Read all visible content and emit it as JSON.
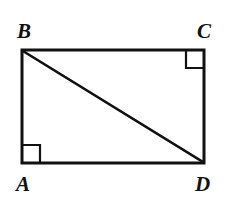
{
  "figure": {
    "background_color": "#ffffff",
    "stroke_color": "#111111",
    "stroke_width": 3,
    "marker_stroke_width": 2,
    "labels": {
      "a": "A",
      "b": "B",
      "c": "C",
      "d": "D"
    },
    "vertices": [
      {
        "name": "B",
        "role": "top-left",
        "x": 22,
        "y": 50
      },
      {
        "name": "C",
        "role": "top-right",
        "x": 204,
        "y": 50
      },
      {
        "name": "D",
        "role": "bottom-right",
        "x": 204,
        "y": 163
      },
      {
        "name": "A",
        "role": "bottom-left",
        "x": 22,
        "y": 163
      }
    ],
    "edges": [
      {
        "name": "BC",
        "from": "B",
        "to": "C"
      },
      {
        "name": "CD",
        "from": "C",
        "to": "D"
      },
      {
        "name": "DA",
        "from": "D",
        "to": "A"
      },
      {
        "name": "AB",
        "from": "A",
        "to": "B"
      }
    ],
    "diagonal": {
      "name": "BD",
      "from": "B",
      "to": "D"
    },
    "right_angle_markers": [
      {
        "at": "C",
        "size": 18
      },
      {
        "at": "A",
        "size": 18
      }
    ]
  }
}
